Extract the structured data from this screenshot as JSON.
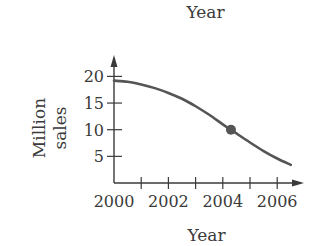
{
  "chart_data": {
    "type": "line",
    "title": "Year",
    "xlabel": "Year",
    "ylabel": "Million sales",
    "ylabel_lines": [
      "Million",
      "sales"
    ],
    "x_tick_labels": [
      "2000",
      "2002",
      "2004",
      "2006"
    ],
    "x_ticks": [
      2000,
      2001,
      2002,
      2003,
      2004,
      2005,
      2006
    ],
    "y_tick_labels": [
      "5",
      "10",
      "15",
      "20"
    ],
    "y_ticks": [
      5,
      10,
      15,
      20
    ],
    "xlim": [
      2000,
      2007
    ],
    "ylim": [
      0,
      22
    ],
    "grid": false,
    "legend": null,
    "series": [
      {
        "name": "Million sales",
        "x": [
          2000,
          2000.5,
          2001,
          2001.5,
          2002,
          2002.5,
          2003,
          2003.5,
          2004,
          2004.3,
          2004.5,
          2005,
          2005.5,
          2006,
          2006.5
        ],
        "values": [
          19.2,
          19.0,
          18.5,
          17.8,
          16.9,
          15.8,
          14.4,
          12.8,
          11.0,
          10.0,
          9.3,
          7.6,
          6.0,
          4.6,
          3.4
        ]
      }
    ],
    "annotations": [
      {
        "type": "point",
        "x": 2004.3,
        "y": 10,
        "label": ""
      }
    ]
  },
  "colors": {
    "axis": "#3a3a3a",
    "curve": "#555555",
    "point": "#555555"
  }
}
